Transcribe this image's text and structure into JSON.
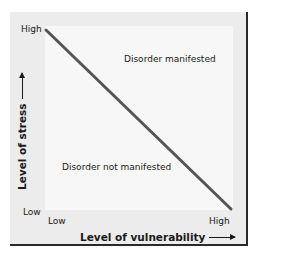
{
  "diagram": {
    "y_axis": {
      "title": "Level of stress",
      "high_label": "High",
      "low_label": "Low",
      "arrow_icon": "arrow-up-icon"
    },
    "x_axis": {
      "title": "Level of vulnerability",
      "low_label": "Low",
      "high_label": "High",
      "arrow_icon": "arrow-right-icon"
    },
    "regions": {
      "above_line": "Disorder manifested",
      "below_line": "Disorder not manifested"
    },
    "line": {
      "from": "High stress / Low vulnerability",
      "to": "Low stress / High vulnerability",
      "color": "#555555"
    },
    "colors": {
      "panel_background": "#ececec",
      "plot_background": "#f7f7f7",
      "border": "#2a2a2a",
      "text": "#1a1a1a"
    }
  }
}
